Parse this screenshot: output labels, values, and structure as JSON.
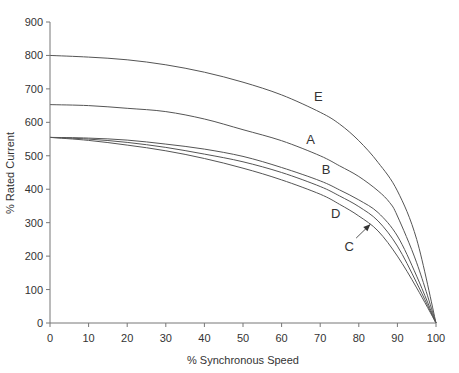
{
  "chart_data": {
    "type": "line",
    "title": "",
    "xlabel": "% Synchronous Speed",
    "ylabel": "% Rated Current",
    "xlim": [
      0,
      100
    ],
    "ylim": [
      0,
      900
    ],
    "xticks": [
      0,
      10,
      20,
      30,
      40,
      50,
      60,
      70,
      80,
      90,
      100
    ],
    "yticks": [
      0,
      100,
      200,
      300,
      400,
      500,
      600,
      700,
      800,
      900
    ],
    "grid": false,
    "legend": "none (curves labeled inline)",
    "series": [
      {
        "name": "E",
        "x": [
          0,
          10,
          20,
          30,
          40,
          50,
          60,
          70,
          75,
          80,
          85,
          90,
          95,
          100
        ],
        "values": [
          800,
          795,
          787,
          772,
          750,
          720,
          682,
          630,
          595,
          545,
          480,
          395,
          250,
          0
        ]
      },
      {
        "name": "A",
        "x": [
          0,
          10,
          20,
          30,
          40,
          50,
          60,
          70,
          75,
          80,
          85,
          88,
          90,
          95,
          100
        ],
        "values": [
          653,
          650,
          642,
          632,
          610,
          578,
          545,
          500,
          470,
          438,
          395,
          360,
          320,
          180,
          0
        ]
      },
      {
        "name": "B",
        "x": [
          0,
          10,
          20,
          30,
          40,
          50,
          60,
          70,
          75,
          80,
          85,
          90,
          95,
          100
        ],
        "values": [
          555,
          553,
          547,
          535,
          520,
          498,
          465,
          425,
          398,
          368,
          330,
          260,
          140,
          0
        ]
      },
      {
        "name": "C",
        "x": [
          0,
          10,
          20,
          30,
          40,
          50,
          60,
          70,
          75,
          80,
          85,
          90,
          95,
          100
        ],
        "values": [
          555,
          550,
          540,
          525,
          505,
          482,
          450,
          408,
          380,
          348,
          305,
          230,
          120,
          0
        ]
      },
      {
        "name": "D",
        "x": [
          0,
          10,
          20,
          30,
          40,
          50,
          60,
          70,
          75,
          80,
          85,
          90,
          95,
          100
        ],
        "values": [
          555,
          546,
          532,
          515,
          492,
          463,
          428,
          385,
          355,
          320,
          275,
          200,
          105,
          0
        ]
      }
    ],
    "annotations": [
      {
        "text": "E",
        "x": 69.5,
        "y": 665
      },
      {
        "text": "A",
        "x": 67.5,
        "y": 535
      },
      {
        "text": "B",
        "x": 71.5,
        "y": 445
      },
      {
        "text": "D",
        "x": 74,
        "y": 315
      },
      {
        "text": "C",
        "x": 77.5,
        "y": 215,
        "arrow_to": {
          "x": 83,
          "y": 295
        }
      }
    ]
  }
}
